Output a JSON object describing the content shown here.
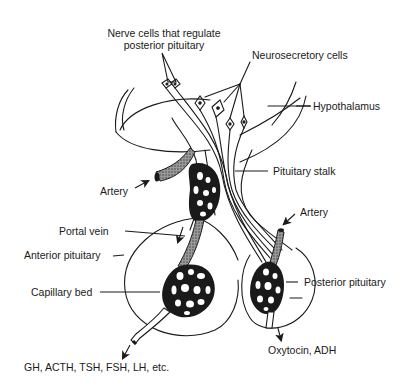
{
  "diagram": {
    "colors": {
      "line": "#1a1a1a",
      "background": "#ffffff",
      "vessel_fill": "#2a2a2a",
      "vessel_stipple": "#8a8a8a"
    },
    "labels": {
      "nerve_cells_line1": "Nerve cells that regulate",
      "nerve_cells_line2": "posterior pituitary",
      "neurosecretory_cells": "Neurosecretory cells",
      "hypothalamus": "Hypothalamus",
      "artery_upper": "Artery",
      "pituitary_stalk": "Pituitary stalk",
      "artery_right": "Artery",
      "portal_vein": "Portal vein",
      "anterior_pituitary": "Anterior pituitary",
      "posterior_pituitary": "Posterior pituitary",
      "capillary_bed": "Capillary bed",
      "anterior_outputs": "GH, ACTH, TSH, FSH, LH, etc.",
      "posterior_outputs": "Oxytocin, ADH"
    }
  }
}
